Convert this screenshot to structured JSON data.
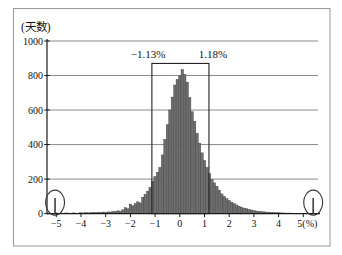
{
  "chart_data": {
    "type": "bar",
    "subtype": "histogram",
    "title": "",
    "ylabel": "(天数)",
    "xlabel": "",
    "x_unit_suffix": "(%)",
    "ylim": [
      0,
      1000
    ],
    "xlim": [
      -5.4,
      5.65
    ],
    "grid": true,
    "y_ticks": [
      0,
      200,
      400,
      600,
      800,
      1000
    ],
    "y_tick_labels": [
      "0",
      "200",
      "400",
      "600",
      "800",
      "1000"
    ],
    "x_ticks": [
      -5,
      -4,
      -3,
      -2,
      -1,
      0,
      1,
      2,
      3,
      4,
      5
    ],
    "x_tick_labels": [
      "−5",
      "−4",
      "−3",
      "−2",
      "−1",
      "0",
      "1",
      "2",
      "3",
      "4",
      "5(%)"
    ],
    "bin_start": -5.0,
    "bin_step": 0.1,
    "heights": [
      4,
      2,
      3,
      2,
      4,
      3,
      2,
      4,
      3,
      2,
      5,
      3,
      6,
      4,
      5,
      7,
      5,
      8,
      6,
      9,
      7,
      10,
      9,
      13,
      11,
      16,
      14,
      22,
      34,
      28,
      55,
      45,
      58,
      68,
      62,
      95,
      112,
      130,
      152,
      188,
      215,
      240,
      268,
      340,
      430,
      515,
      600,
      675,
      745,
      778,
      798,
      835,
      806,
      762,
      672,
      590,
      535,
      465,
      408,
      352,
      308,
      268,
      232,
      198,
      178,
      158,
      136,
      114,
      100,
      86,
      76,
      66,
      58,
      50,
      43,
      37,
      32,
      28,
      24,
      21,
      18,
      15,
      13,
      11,
      10,
      9,
      8,
      7,
      6,
      5,
      5,
      4,
      4,
      3,
      3,
      3,
      2,
      2,
      2,
      2,
      2
    ],
    "annotation_box": {
      "left": -1.13,
      "right": 1.18,
      "top": 870,
      "bottom": 0,
      "left_label": "−1.13%",
      "right_label": "1.18%"
    },
    "outlier_spikes": [
      {
        "x": -5.05,
        "height": 90,
        "circled": true
      },
      {
        "x": 5.4,
        "height": 90,
        "circled": true
      }
    ],
    "colors": {
      "bar_fill": "#6e6e6e",
      "bar_stroke": "#3f3f3f",
      "axis": "#1a1a1a",
      "grid": "#666666",
      "frame": "#999999",
      "annotation": "#222222",
      "ellipse": "#333333",
      "background": "#ffffff"
    }
  }
}
